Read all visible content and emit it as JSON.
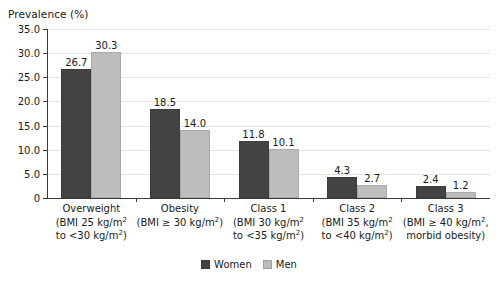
{
  "chart_data": {
    "type": "bar",
    "title": "Prevalence (%)",
    "xlabel": "",
    "ylabel": "Prevalence (%)",
    "ylim": [
      0,
      35
    ],
    "ytick_labels": [
      "35.0",
      "30.0",
      "25.0",
      "20.0",
      "15.0",
      "10.0",
      "5.0",
      "0"
    ],
    "ytick_values": [
      35,
      30,
      25,
      20,
      15,
      10,
      5,
      0
    ],
    "grid": true,
    "legend_position": "bottom-center",
    "categories": [
      "Overweight (BMI 25 kg/m2 to <30 kg/m2)",
      "Obesity (BMI ≥ 30 kg/m2)",
      "Class 1 (BMI 30 kg/m2 to <35 kg/m2)",
      "Class 2 (BMI 35 kg/m2 to <40 kg/m2)",
      "Class 3 (BMI ≥ 40 kg/m2, morbid obesity)"
    ],
    "series": [
      {
        "name": "Women",
        "color": "#434343",
        "values": [
          26.7,
          18.5,
          11.8,
          4.3,
          2.4
        ]
      },
      {
        "name": "Men",
        "color": "#bdbdbd",
        "values": [
          30.3,
          14.0,
          10.1,
          2.7,
          1.2
        ]
      }
    ],
    "value_labels": {
      "women": [
        "26.7",
        "18.5",
        "11.8",
        "4.3",
        "2.4"
      ],
      "men": [
        "30.3",
        "14.0",
        "10.1",
        "2.7",
        "1.2"
      ]
    }
  },
  "category_labels": [
    {
      "name": "Overweight",
      "line2": "(BMI 25 kg/m",
      "line2_sup": "2",
      "line2_end": "",
      "line3": "to <30 kg/m",
      "line3_sup": "2",
      "line3_end": ")"
    },
    {
      "name": "Obesity",
      "line2": "(BMI ≥ 30 kg/m",
      "line2_sup": "2",
      "line2_end": ")",
      "line3": "",
      "line3_sup": "",
      "line3_end": ""
    },
    {
      "name": "Class 1",
      "line2": "(BMI 30 kg/m",
      "line2_sup": "2",
      "line2_end": "",
      "line3": "to <35 kg/m",
      "line3_sup": "2",
      "line3_end": ")"
    },
    {
      "name": "Class 2",
      "line2": "(BMI 35 kg/m",
      "line2_sup": "2",
      "line2_end": "",
      "line3": "to <40 kg/m",
      "line3_sup": "2",
      "line3_end": ")"
    },
    {
      "name": "Class 3",
      "line2": "(BMI ≥ 40 kg/m",
      "line2_sup": "2",
      "line2_end": ",",
      "line3": "morbid obesity)",
      "line3_sup": "",
      "line3_end": ""
    }
  ],
  "legend": {
    "items": [
      {
        "label": "Women",
        "color": "#434343"
      },
      {
        "label": "Men",
        "color": "#bdbdbd"
      }
    ]
  }
}
